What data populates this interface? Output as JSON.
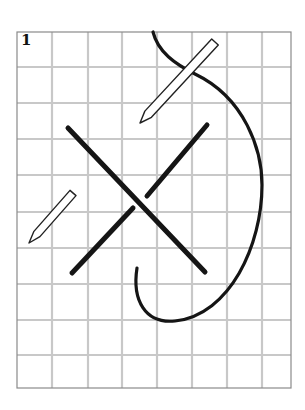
{
  "figure": {
    "step_number": "1",
    "colors": {
      "background": "#ffffff",
      "grid_line": "#c8c8c8",
      "frame": "#8a8a8a",
      "thread": "#151515",
      "needle_fill": "#ffffff",
      "needle_outline": "#222222"
    },
    "grid": {
      "frame": {
        "x": 17,
        "y": 32,
        "width": 274,
        "height": 356
      },
      "vertical_lines_x": [
        52,
        88,
        122,
        157,
        192,
        227,
        262
      ],
      "horizontal_lines_y": [
        67,
        103,
        139,
        175,
        212,
        248,
        284,
        320,
        355
      ]
    },
    "stitches": [
      {
        "name": "diagonal-stitch-1",
        "from": [
          68,
          128
        ],
        "to": [
          205,
          272
        ]
      },
      {
        "name": "diagonal-stitch-2-upper",
        "from": [
          207,
          125
        ],
        "to": [
          147,
          196
        ]
      },
      {
        "name": "diagonal-stitch-2-lower",
        "from": [
          133,
          208
        ],
        "to": [
          72,
          273
        ]
      }
    ],
    "thread_loop": {
      "path": "M153,32 C158,52 175,64 195,74 C245,98 262,150 262,185 C262,245 230,315 175,321 C145,324 132,300 137,268"
    },
    "needles": [
      {
        "name": "large-needle",
        "tip": [
          140,
          123
        ],
        "eye": [
          215,
          42
        ],
        "width": 9
      },
      {
        "name": "small-needle",
        "tip": [
          29,
          243
        ],
        "eye": [
          73,
          193
        ],
        "width": 8
      }
    ]
  }
}
